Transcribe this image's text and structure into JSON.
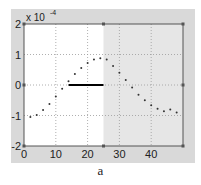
{
  "caption": "a",
  "chart_data": {
    "type": "scatter",
    "title": "",
    "xlabel": "",
    "ylabel": "",
    "y_exponent_label": "x 10^-4",
    "xlim": [
      0,
      50
    ],
    "ylim": [
      -2,
      2
    ],
    "y_scale": 0.0001,
    "x_ticks": [
      0,
      10,
      20,
      30,
      40
    ],
    "y_ticks": [
      -2,
      -1,
      0,
      1,
      2
    ],
    "grid": true,
    "shaded_region": {
      "x_start": 25,
      "x_end": 50,
      "color": "#e6e6e6"
    },
    "segment": {
      "x_start": 14,
      "x_end": 25,
      "y": 0,
      "color": "#000000"
    },
    "series": [
      {
        "name": "samples",
        "marker": "dot",
        "x": [
          2,
          4,
          6,
          8,
          10,
          12,
          14,
          16,
          18,
          20,
          22,
          24,
          26,
          28,
          30,
          32,
          34,
          36,
          38,
          40,
          42,
          44,
          46,
          48
        ],
        "y": [
          -1.05,
          -0.98,
          -0.82,
          -0.62,
          -0.38,
          -0.12,
          0.12,
          0.36,
          0.56,
          0.72,
          0.84,
          0.88,
          0.84,
          0.62,
          0.4,
          0.16,
          -0.08,
          -0.32,
          -0.5,
          -0.66,
          -0.78,
          -0.86,
          -0.8,
          -0.9
        ]
      }
    ]
  }
}
